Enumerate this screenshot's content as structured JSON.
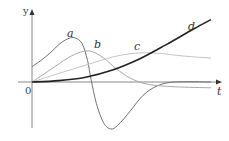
{
  "chart_data": {
    "type": "line",
    "title": "",
    "xlabel": "t",
    "ylabel": "y",
    "origin_label": "0",
    "grid": false,
    "legend": "none (curves labeled inline)",
    "x_range": [
      0,
      1
    ],
    "y_range": [
      -1,
      1.5
    ],
    "series": [
      {
        "name": "a",
        "color": "#707070",
        "description": "starts above zero, rises to a peak, falls sharply through zero to a deep minimum, then returns toward zero",
        "points": [
          [
            0,
            0.32
          ],
          [
            0.05,
            0.45
          ],
          [
            0.1,
            0.6
          ],
          [
            0.15,
            0.78
          ],
          [
            0.2,
            0.9
          ],
          [
            0.24,
            0.92
          ],
          [
            0.28,
            0.8
          ],
          [
            0.31,
            0.45
          ],
          [
            0.33,
            0.05
          ],
          [
            0.36,
            -0.45
          ],
          [
            0.4,
            -0.85
          ],
          [
            0.44,
            -0.98
          ],
          [
            0.48,
            -0.9
          ],
          [
            0.55,
            -0.6
          ],
          [
            0.62,
            -0.28
          ],
          [
            0.7,
            -0.08
          ],
          [
            0.8,
            0.0
          ],
          [
            1.0,
            0.0
          ]
        ]
      },
      {
        "name": "b",
        "color": "#a8a8a8",
        "description": "starts at zero, rises to a moderate peak, decays to slightly below zero",
        "points": [
          [
            0,
            0
          ],
          [
            0.1,
            0.25
          ],
          [
            0.2,
            0.5
          ],
          [
            0.27,
            0.62
          ],
          [
            0.33,
            0.64
          ],
          [
            0.4,
            0.5
          ],
          [
            0.47,
            0.28
          ],
          [
            0.55,
            0.08
          ],
          [
            0.65,
            -0.05
          ],
          [
            0.8,
            -0.1
          ],
          [
            1.0,
            -0.12
          ]
        ]
      },
      {
        "name": "c",
        "color": "#c4c4c4",
        "description": "starts at zero, rises slowly to a broad peak, levels off",
        "points": [
          [
            0,
            0
          ],
          [
            0.15,
            0.18
          ],
          [
            0.3,
            0.35
          ],
          [
            0.45,
            0.52
          ],
          [
            0.58,
            0.6
          ],
          [
            0.7,
            0.6
          ],
          [
            0.85,
            0.54
          ],
          [
            1.0,
            0.5
          ]
        ]
      },
      {
        "name": "d",
        "color": "#222222",
        "description": "starts at zero, increases monotonically and accelerates",
        "points": [
          [
            0,
            0
          ],
          [
            0.15,
            0.03
          ],
          [
            0.3,
            0.1
          ],
          [
            0.45,
            0.25
          ],
          [
            0.6,
            0.48
          ],
          [
            0.75,
            0.78
          ],
          [
            0.9,
            1.1
          ],
          [
            1.0,
            1.3
          ]
        ]
      }
    ]
  }
}
